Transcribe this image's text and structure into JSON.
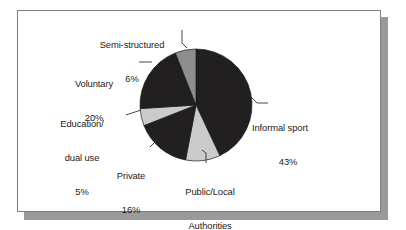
{
  "figure": {
    "frame_border_color": "#7d7d7d",
    "shadow_color": "#9a9a9a",
    "background_color": "#ffffff"
  },
  "chart_data": {
    "type": "pie",
    "title": "",
    "subtitle": "",
    "xlabel": "",
    "ylabel": "",
    "grid": false,
    "legend_position": "none",
    "label_style": "outside-with-leader-lines",
    "start_angle_deg": 0,
    "direction": "clockwise",
    "center_px": [
      196,
      105
    ],
    "radius_px": 56,
    "total_percent": 100,
    "categories": [
      "Informal sport",
      "Public/Local Authorities",
      "Private",
      "Education/dual use",
      "Voluntary",
      "Semi-structured"
    ],
    "values": [
      43,
      10,
      16,
      5,
      20,
      6
    ],
    "slices": [
      {
        "name": "Informal sport",
        "label_lines": [
          "Informal sport",
          "43%"
        ],
        "value": 43,
        "percent_text": "43%",
        "color": "#211f1f",
        "start_deg": 0,
        "end_deg": 154.8
      },
      {
        "name": "Public/Local Authorities",
        "label_lines": [
          "Public/Local",
          "Authorities",
          "10%"
        ],
        "value": 10,
        "percent_text": "10%",
        "color": "#cbcbcb",
        "start_deg": 154.8,
        "end_deg": 190.8
      },
      {
        "name": "Private",
        "label_lines": [
          "Private",
          "16%"
        ],
        "value": 16,
        "percent_text": "16%",
        "color": "#211f1f",
        "start_deg": 190.8,
        "end_deg": 248.4
      },
      {
        "name": "Education/dual use",
        "label_lines": [
          "Education/",
          "dual use",
          "5%"
        ],
        "value": 5,
        "percent_text": "5%",
        "color": "#cbcbcb",
        "start_deg": 248.4,
        "end_deg": 266.4
      },
      {
        "name": "Voluntary",
        "label_lines": [
          "Voluntary",
          "20%"
        ],
        "value": 20,
        "percent_text": "20%",
        "color": "#211f1f",
        "start_deg": 266.4,
        "end_deg": 338.4
      },
      {
        "name": "Semi-structured",
        "label_lines": [
          "Semi-structured",
          "6%"
        ],
        "value": 6,
        "percent_text": "6%",
        "color": "#8e8e8e",
        "start_deg": 338.4,
        "end_deg": 360
      }
    ]
  },
  "labels": {
    "semi_structured": {
      "line1": "Semi-structured",
      "line2": "6%"
    },
    "voluntary": {
      "line1": "Voluntary",
      "line2": "20%"
    },
    "education": {
      "line1": "Education/",
      "line2": "dual use",
      "line3": "5%"
    },
    "private": {
      "line1": "Private",
      "line2": "16%"
    },
    "public_local": {
      "line1": "Public/Local",
      "line2": "Authorities",
      "line3": "10%"
    },
    "informal_sport": {
      "line1": "Informal sport",
      "line2": "43%"
    }
  }
}
